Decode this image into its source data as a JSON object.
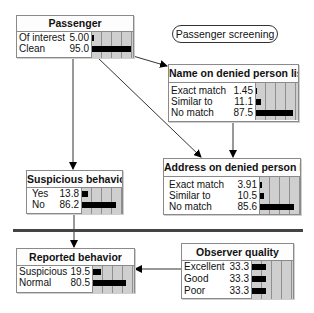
{
  "title_label": "Passenger screening",
  "nodes": {
    "passenger": {
      "title": "Passenger",
      "states": [
        {
          "label": "Of interest",
          "value": "5.00",
          "pct": 5.0
        },
        {
          "label": "Clean",
          "value": "95.0",
          "pct": 95.0
        }
      ]
    },
    "name_list": {
      "title": "Name on denied person list",
      "states": [
        {
          "label": "Exact match",
          "value": "1.45",
          "pct": 1.45
        },
        {
          "label": "Similar to",
          "value": "11.1",
          "pct": 11.1
        },
        {
          "label": "No match",
          "value": "87.5",
          "pct": 87.5
        }
      ]
    },
    "address_list": {
      "title": "Address on denied person list",
      "states": [
        {
          "label": "Exact match",
          "value": "3.91",
          "pct": 3.91
        },
        {
          "label": "Similar to",
          "value": "10.5",
          "pct": 10.5
        },
        {
          "label": "No match",
          "value": "85.6",
          "pct": 85.6
        }
      ]
    },
    "suspicious": {
      "title": "Suspicious behavior",
      "states": [
        {
          "label": "Yes",
          "value": "13.8",
          "pct": 13.8
        },
        {
          "label": "No",
          "value": "86.2",
          "pct": 86.2
        }
      ]
    },
    "reported": {
      "title": "Reported behavior",
      "states": [
        {
          "label": "Suspicious",
          "value": "19.5",
          "pct": 19.5
        },
        {
          "label": "Normal",
          "value": "80.5",
          "pct": 80.5
        }
      ]
    },
    "observer": {
      "title": "Observer quality",
      "states": [
        {
          "label": "Excellent",
          "value": "33.3",
          "pct": 33.3
        },
        {
          "label": "Good",
          "value": "33.3",
          "pct": 33.3
        },
        {
          "label": "Poor",
          "value": "33.3",
          "pct": 33.3
        }
      ]
    }
  },
  "edges": [
    {
      "from": "Passenger",
      "to": "Name on denied person list"
    },
    {
      "from": "Passenger",
      "to": "Address on denied person list"
    },
    {
      "from": "Passenger",
      "to": "Suspicious behavior"
    },
    {
      "from": "Name on denied person list",
      "to": "Address on denied person list"
    },
    {
      "from": "Suspicious behavior",
      "to": "Reported behavior"
    },
    {
      "from": "Observer quality",
      "to": "Reported behavior"
    }
  ],
  "colors": {
    "bar": "#000000",
    "bar_bg": "#cfcfcf",
    "border": "#8a8a8a",
    "separator": "#444444"
  }
}
